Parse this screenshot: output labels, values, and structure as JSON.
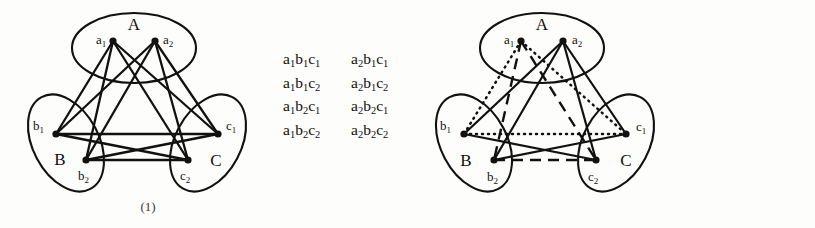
{
  "figure": {
    "background_color": "#fdfdfb",
    "ink_color": "#111111"
  },
  "panels": [
    {
      "caption": "(1)",
      "parts": [
        {
          "label": "A",
          "vertices": [
            {
              "name": "a1",
              "base": "a",
              "sub": "1"
            },
            {
              "name": "a2",
              "base": "a",
              "sub": "2"
            }
          ]
        },
        {
          "label": "B",
          "vertices": [
            {
              "name": "b1",
              "base": "b",
              "sub": "1"
            },
            {
              "name": "b2",
              "base": "b",
              "sub": "2"
            }
          ]
        },
        {
          "label": "C",
          "vertices": [
            {
              "name": "c1",
              "base": "c",
              "sub": "1"
            },
            {
              "name": "c2",
              "base": "c",
              "sub": "2"
            }
          ]
        }
      ],
      "triples": [
        [
          {
            "a": "1",
            "b": "1",
            "c": "1"
          },
          {
            "a": "2",
            "b": "1",
            "c": "1"
          }
        ],
        [
          {
            "a": "1",
            "b": "1",
            "c": "2"
          },
          {
            "a": "2",
            "b": "1",
            "c": "2"
          }
        ],
        [
          {
            "a": "1",
            "b": "2",
            "c": "1"
          },
          {
            "a": "2",
            "b": "2",
            "c": "1"
          }
        ],
        [
          {
            "a": "1",
            "b": "2",
            "c": "2"
          },
          {
            "a": "2",
            "b": "2",
            "c": "2"
          }
        ]
      ]
    },
    {
      "caption": "(2)",
      "parts": [
        {
          "label": "A",
          "vertices": [
            {
              "name": "a1",
              "base": "a",
              "sub": "1"
            },
            {
              "name": "a2",
              "base": "a",
              "sub": "2"
            }
          ]
        },
        {
          "label": "B",
          "vertices": [
            {
              "name": "b1",
              "base": "b",
              "sub": "1"
            },
            {
              "name": "b2",
              "base": "b",
              "sub": "2"
            }
          ]
        },
        {
          "label": "C",
          "vertices": [
            {
              "name": "c1",
              "base": "c",
              "sub": "1"
            },
            {
              "name": "c2",
              "base": "c",
              "sub": "2"
            }
          ]
        }
      ],
      "triples": [
        [
          {
            "a": "1",
            "b": "1",
            "c": "1"
          }
        ],
        [
          {
            "a": "2",
            "b": "1",
            "c": "2"
          }
        ],
        [
          {
            "a": "2",
            "b": "2",
            "c": "1"
          }
        ],
        [
          {
            "a": "1",
            "b": "2",
            "c": "2"
          }
        ]
      ]
    }
  ],
  "graph_data": {
    "type": "diagram",
    "vertex_positions": {
      "a1": [
        113,
        41
      ],
      "a2": [
        155,
        41
      ],
      "b1": [
        56,
        134
      ],
      "b2": [
        86,
        160
      ],
      "c1": [
        218,
        134
      ],
      "c2": [
        188,
        160
      ]
    },
    "panel_1_edges": [
      [
        "a1",
        "b1"
      ],
      [
        "a1",
        "b2"
      ],
      [
        "a1",
        "c1"
      ],
      [
        "a1",
        "c2"
      ],
      [
        "a2",
        "b1"
      ],
      [
        "a2",
        "b2"
      ],
      [
        "a2",
        "c1"
      ],
      [
        "a2",
        "c2"
      ],
      [
        "b1",
        "c1"
      ],
      [
        "b1",
        "c2"
      ],
      [
        "b2",
        "c1"
      ],
      [
        "b2",
        "c2"
      ]
    ],
    "panel_2_triangles": [
      {
        "vertices": [
          "a1",
          "b1",
          "c1"
        ],
        "style": "dotted"
      },
      {
        "vertices": [
          "a2",
          "b1",
          "c2"
        ],
        "style": "solid"
      },
      {
        "vertices": [
          "a2",
          "b2",
          "c1"
        ],
        "style": "solid"
      },
      {
        "vertices": [
          "a1",
          "b2",
          "c2"
        ],
        "style": "dashed"
      }
    ]
  }
}
